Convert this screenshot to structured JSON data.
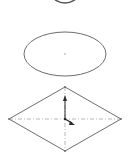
{
  "viewport": {
    "background": "#ffffff",
    "line_color": "#6e6e6e",
    "construction_color": "#9a9a9a",
    "triad_color": "#2a2a2a"
  },
  "shapes": {
    "top_partial_ellipse": {
      "cx": 65,
      "cy": -6,
      "rx": 12,
      "ry": 8
    },
    "ellipse": {
      "cx": 65,
      "cy": 54,
      "rx": 41,
      "ry": 22
    },
    "diamond": {
      "top": [
        65,
        87
      ],
      "right": [
        121,
        119
      ],
      "bottom": [
        65,
        151
      ],
      "left": [
        9,
        119
      ]
    },
    "triad": {
      "origin": [
        65,
        119
      ],
      "up_tip": [
        65,
        96
      ],
      "diag_tip": [
        74,
        125
      ]
    }
  }
}
